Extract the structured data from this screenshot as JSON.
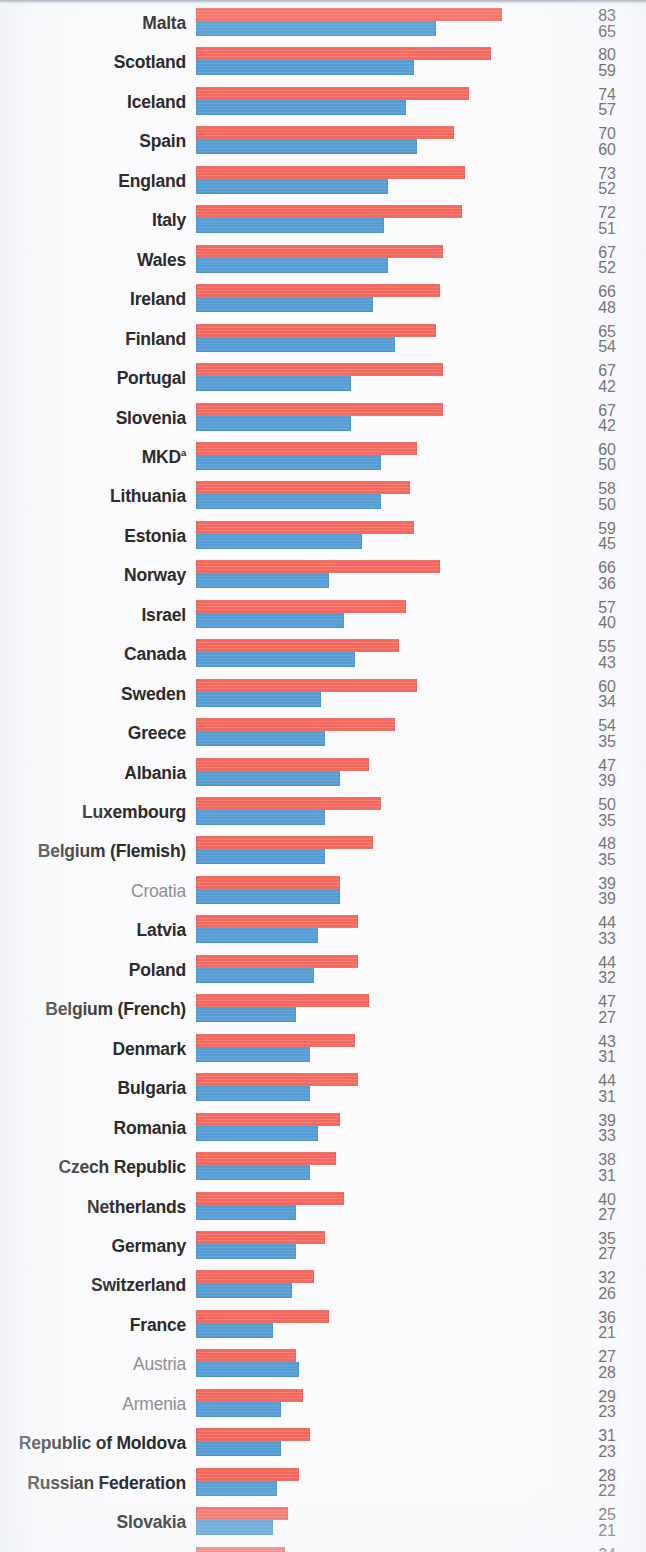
{
  "chart": {
    "type": "bar",
    "orientation": "horizontal-grouped",
    "title": "",
    "xlabel": "",
    "ylabel": "",
    "legend": [],
    "grid": false,
    "xlim": [
      0,
      83
    ],
    "series_names": [
      "top-series-red",
      "bottom-series-blue"
    ],
    "colors": {
      "series_top": "#f4685e",
      "series_bottom": "#559dd4",
      "label_strong": "#2b2b2b",
      "label_muted": "#8d8f92",
      "value_text": "#3a3a3a",
      "background": "#fbfbfd"
    },
    "pixels_per_unit": 3.69,
    "bar_origin_x": 196
  },
  "chart_data": {
    "type": "bar",
    "title": "",
    "xlabel": "",
    "ylabel": "",
    "grid": false,
    "xlim": [
      0,
      83
    ],
    "categories": [
      "Malta",
      "Scotland",
      "Iceland",
      "Spain",
      "England",
      "Italy",
      "Wales",
      "Ireland",
      "Finland",
      "Portugal",
      "Slovenia",
      "MKD",
      "Lithuania",
      "Estonia",
      "Norway",
      "Israel",
      "Canada",
      "Sweden",
      "Greece",
      "Albania",
      "Luxembourg",
      "Belgium (Flemish)",
      "Croatia",
      "Latvia",
      "Poland",
      "Belgium (French)",
      "Denmark",
      "Bulgaria",
      "Romania",
      "Czech Republic",
      "Netherlands",
      "Germany",
      "Switzerland",
      "France",
      "Austria",
      "Armenia",
      "Republic of Moldova",
      "Russian Federation",
      "Slovakia",
      "Hungary",
      "Ukraine"
    ],
    "series": [
      {
        "name": "top-series-red",
        "color": "#f4685e",
        "values": [
          83,
          80,
          74,
          70,
          73,
          72,
          67,
          66,
          65,
          67,
          67,
          60,
          58,
          59,
          66,
          57,
          55,
          60,
          54,
          47,
          50,
          48,
          39,
          44,
          44,
          47,
          43,
          44,
          39,
          38,
          40,
          35,
          32,
          36,
          27,
          29,
          31,
          28,
          25,
          24,
          18
        ]
      },
      {
        "name": "bottom-series-blue",
        "color": "#559dd4",
        "values": [
          65,
          59,
          57,
          60,
          52,
          51,
          52,
          48,
          54,
          42,
          42,
          50,
          50,
          45,
          36,
          40,
          43,
          34,
          35,
          39,
          35,
          35,
          39,
          33,
          32,
          27,
          31,
          31,
          33,
          31,
          27,
          27,
          26,
          21,
          28,
          23,
          23,
          22,
          21,
          19,
          19
        ]
      }
    ]
  },
  "rows": [
    {
      "label": "Malta",
      "footnote": "",
      "emphasis": "strong",
      "top": 83,
      "bottom": 65
    },
    {
      "label": "Scotland",
      "footnote": "",
      "emphasis": "strong",
      "top": 80,
      "bottom": 59
    },
    {
      "label": "Iceland",
      "footnote": "",
      "emphasis": "strong",
      "top": 74,
      "bottom": 57
    },
    {
      "label": "Spain",
      "footnote": "",
      "emphasis": "strong",
      "top": 70,
      "bottom": 60
    },
    {
      "label": "England",
      "footnote": "",
      "emphasis": "strong",
      "top": 73,
      "bottom": 52
    },
    {
      "label": "Italy",
      "footnote": "",
      "emphasis": "strong",
      "top": 72,
      "bottom": 51
    },
    {
      "label": "Wales",
      "footnote": "",
      "emphasis": "strong",
      "top": 67,
      "bottom": 52
    },
    {
      "label": "Ireland",
      "footnote": "",
      "emphasis": "strong",
      "top": 66,
      "bottom": 48
    },
    {
      "label": "Finland",
      "footnote": "",
      "emphasis": "strong",
      "top": 65,
      "bottom": 54
    },
    {
      "label": "Portugal",
      "footnote": "",
      "emphasis": "strong",
      "top": 67,
      "bottom": 42
    },
    {
      "label": "Slovenia",
      "footnote": "",
      "emphasis": "strong",
      "top": 67,
      "bottom": 42
    },
    {
      "label": "MKD",
      "footnote": "a",
      "emphasis": "strong",
      "top": 60,
      "bottom": 50
    },
    {
      "label": "Lithuania",
      "footnote": "",
      "emphasis": "strong",
      "top": 58,
      "bottom": 50
    },
    {
      "label": "Estonia",
      "footnote": "",
      "emphasis": "strong",
      "top": 59,
      "bottom": 45
    },
    {
      "label": "Norway",
      "footnote": "",
      "emphasis": "strong",
      "top": 66,
      "bottom": 36
    },
    {
      "label": "Israel",
      "footnote": "",
      "emphasis": "strong",
      "top": 57,
      "bottom": 40
    },
    {
      "label": "Canada",
      "footnote": "",
      "emphasis": "strong",
      "top": 55,
      "bottom": 43
    },
    {
      "label": "Sweden",
      "footnote": "",
      "emphasis": "strong",
      "top": 60,
      "bottom": 34
    },
    {
      "label": "Greece",
      "footnote": "",
      "emphasis": "strong",
      "top": 54,
      "bottom": 35
    },
    {
      "label": "Albania",
      "footnote": "",
      "emphasis": "strong",
      "top": 47,
      "bottom": 39
    },
    {
      "label": "Luxembourg",
      "footnote": "",
      "emphasis": "strong",
      "top": 50,
      "bottom": 35
    },
    {
      "label": "Belgium (Flemish)",
      "footnote": "",
      "emphasis": "strong",
      "top": 48,
      "bottom": 35
    },
    {
      "label": "Croatia",
      "footnote": "",
      "emphasis": "muted",
      "top": 39,
      "bottom": 39
    },
    {
      "label": "Latvia",
      "footnote": "",
      "emphasis": "strong",
      "top": 44,
      "bottom": 33
    },
    {
      "label": "Poland",
      "footnote": "",
      "emphasis": "strong",
      "top": 44,
      "bottom": 32
    },
    {
      "label": "Belgium (French)",
      "footnote": "",
      "emphasis": "strong",
      "top": 47,
      "bottom": 27
    },
    {
      "label": "Denmark",
      "footnote": "",
      "emphasis": "strong",
      "top": 43,
      "bottom": 31
    },
    {
      "label": "Bulgaria",
      "footnote": "",
      "emphasis": "strong",
      "top": 44,
      "bottom": 31
    },
    {
      "label": "Romania",
      "footnote": "",
      "emphasis": "strong",
      "top": 39,
      "bottom": 33
    },
    {
      "label": "Czech Republic",
      "footnote": "",
      "emphasis": "strong",
      "top": 38,
      "bottom": 31
    },
    {
      "label": "Netherlands",
      "footnote": "",
      "emphasis": "strong",
      "top": 40,
      "bottom": 27
    },
    {
      "label": "Germany",
      "footnote": "",
      "emphasis": "strong",
      "top": 35,
      "bottom": 27
    },
    {
      "label": "Switzerland",
      "footnote": "",
      "emphasis": "strong",
      "top": 32,
      "bottom": 26
    },
    {
      "label": "France",
      "footnote": "",
      "emphasis": "strong",
      "top": 36,
      "bottom": 21
    },
    {
      "label": "Austria",
      "footnote": "",
      "emphasis": "muted",
      "top": 27,
      "bottom": 28
    },
    {
      "label": "Armenia",
      "footnote": "",
      "emphasis": "muted",
      "top": 29,
      "bottom": 23
    },
    {
      "label": "Republic of Moldova",
      "footnote": "",
      "emphasis": "strong",
      "top": 31,
      "bottom": 23
    },
    {
      "label": "Russian Federation",
      "footnote": "",
      "emphasis": "strong",
      "top": 28,
      "bottom": 22
    },
    {
      "label": "Slovakia",
      "footnote": "",
      "emphasis": "strong",
      "top": 25,
      "bottom": 21
    },
    {
      "label": "Hungary",
      "footnote": "",
      "emphasis": "muted",
      "top": 24,
      "bottom": 19
    },
    {
      "label": "Ukraine",
      "footnote": "",
      "emphasis": "muted",
      "top": 18,
      "bottom": 19
    }
  ]
}
